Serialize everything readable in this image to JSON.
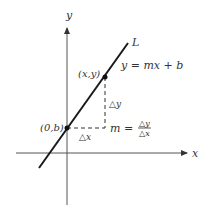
{
  "diagram": {
    "axes": {
      "x_label": "x",
      "y_label": "y"
    },
    "line": {
      "label": "L",
      "equation": "y = mx + b"
    },
    "points": [
      {
        "label": "(0,b)"
      },
      {
        "label": "(x,y)"
      }
    ],
    "delta_x": "△x",
    "delta_y": "△y",
    "slope": {
      "lhs": "m =",
      "numerator": "△y",
      "denominator": "△x"
    },
    "colors": {
      "line": "#1a1a1a",
      "axes": "#555555",
      "text": "#333333"
    }
  }
}
